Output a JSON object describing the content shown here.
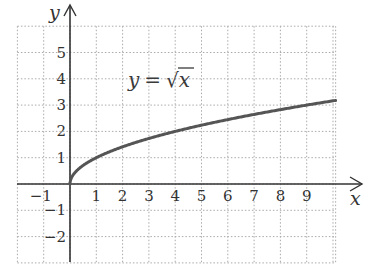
{
  "chart_data": {
    "type": "line",
    "title": "",
    "annotation": "y = √x",
    "annotation_parts": {
      "lhs": "y",
      "eq": "=",
      "radical": "√",
      "arg": "x"
    },
    "xlabel": "x",
    "ylabel": "y",
    "xlim": [
      -2,
      10.1
    ],
    "ylim": [
      -3,
      6
    ],
    "grid": true,
    "grid_style": "dotted",
    "x_ticks": [
      -1,
      1,
      2,
      3,
      4,
      5,
      6,
      7,
      8,
      9
    ],
    "x_tick_labels": [
      "−1",
      "1",
      "2",
      "3",
      "4",
      "5",
      "6",
      "7",
      "8",
      "9"
    ],
    "y_ticks": [
      -2,
      -1,
      1,
      2,
      3,
      4,
      5
    ],
    "y_tick_labels": [
      "−2",
      "−1",
      "1",
      "2",
      "3",
      "4",
      "5"
    ],
    "series": [
      {
        "name": "y = √x",
        "function": "sqrt",
        "x": [
          0,
          0.25,
          1,
          2,
          3,
          4,
          5,
          6,
          7,
          8,
          9,
          10
        ],
        "y": [
          0,
          0.5,
          1,
          1.414,
          1.732,
          2,
          2.236,
          2.449,
          2.646,
          2.828,
          3,
          3.162
        ],
        "color": "#555555"
      }
    ],
    "colors": {
      "axis": "#333333",
      "grid": "#aaaaaa",
      "curve": "#555555"
    }
  }
}
